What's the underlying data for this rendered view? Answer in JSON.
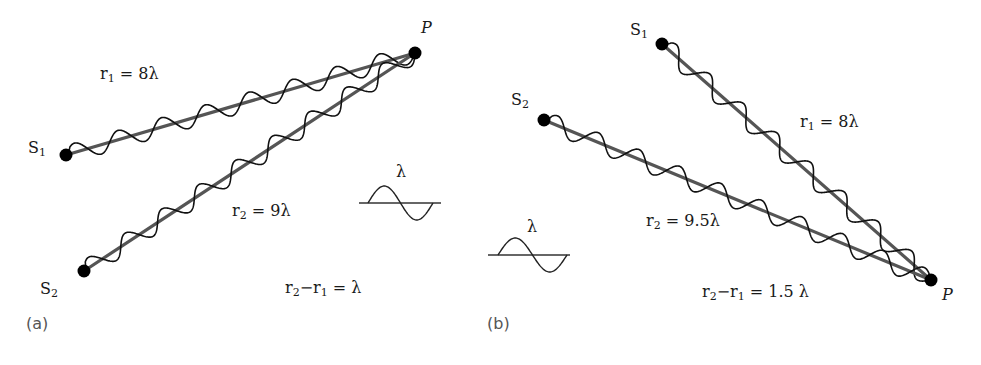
{
  "colors": {
    "line": "#555555",
    "wave": "#111111",
    "dot": "#000000",
    "text": "#1a1a1a",
    "panel_tag": "#555555"
  },
  "panels": [
    {
      "id": "a",
      "tag": "(a)",
      "tag_pos": [
        26,
        316
      ],
      "point": {
        "label": "P",
        "pos": [
          415,
          53
        ],
        "label_pos": [
          421,
          20
        ]
      },
      "sources": [
        {
          "label": "S",
          "sub": "1",
          "pos": [
            66,
            155
          ],
          "label_pos": [
            28,
            140
          ],
          "wavelengths": 8
        },
        {
          "label": "S",
          "sub": "2",
          "pos": [
            84,
            271
          ],
          "label_pos": [
            40,
            281
          ],
          "wavelengths": 9
        }
      ],
      "paths": [
        {
          "text": "r",
          "sub": "1",
          "rest": " = 8λ",
          "pos": [
            100,
            66
          ]
        },
        {
          "text": "r",
          "sub": "2",
          "rest": " = 9λ",
          "pos": [
            232,
            203
          ]
        }
      ],
      "difference": {
        "text": "r",
        "sub": "2",
        "mid": "−r",
        "sub2": "1",
        "rest": " = λ",
        "pos": [
          285,
          280
        ]
      },
      "legend": {
        "symbol": "λ",
        "baseline_y": 203,
        "x0": 359,
        "x1": 441,
        "wave_x0": 368,
        "wave_x1": 433,
        "amp": 17,
        "symbol_pos": [
          396,
          164
        ]
      }
    },
    {
      "id": "b",
      "tag": "(b)",
      "tag_pos": [
        487,
        316
      ],
      "point": {
        "label": "P",
        "pos": [
          931,
          280
        ],
        "label_pos": [
          942,
          287
        ]
      },
      "sources": [
        {
          "label": "S",
          "sub": "1",
          "pos": [
            662,
            44
          ],
          "label_pos": [
            630,
            22
          ],
          "wavelengths": 8
        },
        {
          "label": "S",
          "sub": "2",
          "pos": [
            544,
            120
          ],
          "label_pos": [
            511,
            92
          ],
          "wavelengths": 9.5
        }
      ],
      "paths": [
        {
          "text": "r",
          "sub": "1",
          "rest": " = 8λ",
          "pos": [
            800,
            114
          ]
        },
        {
          "text": "r",
          "sub": "2",
          "rest": " = 9.5λ",
          "pos": [
            646,
            213
          ]
        }
      ],
      "difference": {
        "text": "r",
        "sub": "2",
        "mid": "−r",
        "sub2": "1",
        "rest": " = 1.5 λ",
        "pos": [
          702,
          284
        ]
      },
      "legend": {
        "symbol": "λ",
        "baseline_y": 255,
        "x0": 488,
        "x1": 570,
        "wave_x0": 498,
        "wave_x1": 567,
        "amp": 17,
        "symbol_pos": [
          527,
          219
        ]
      }
    }
  ],
  "wave": {
    "amplitude": 9
  }
}
